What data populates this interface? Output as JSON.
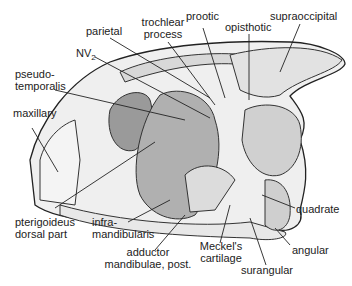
{
  "figure": {
    "labels": {
      "parietal": "parietal",
      "trochlear_process_1": "trochlear",
      "trochlear_process_2": "process",
      "prootic": "prootic",
      "opisthotic": "opisthotic",
      "supraoccipital": "supraoccipital",
      "nv2_main": "NV",
      "nv2_sub": "2",
      "pseudotemporalis_1": "pseudo-",
      "pseudotemporalis_2": "temporalis",
      "maxillary": "maxillary",
      "pterigoideus_1": "pterigoideus",
      "pterigoideus_2": "dorsal part",
      "inframandibularis_1": "infra-",
      "inframandibularis_2": "mandibularis",
      "adductor_1": "adductor",
      "adductor_2": "mandibulae, post.",
      "meckels_1": "Meckel's",
      "meckels_2": "cartilage",
      "surangular": "surangular",
      "angular": "angular",
      "quadrate": "quadrate"
    },
    "colors": {
      "ink": "#222222",
      "fill_light": "#e6e6e6",
      "fill_mid": "#bdbdbd",
      "fill_dark": "#7a7a7a"
    }
  }
}
